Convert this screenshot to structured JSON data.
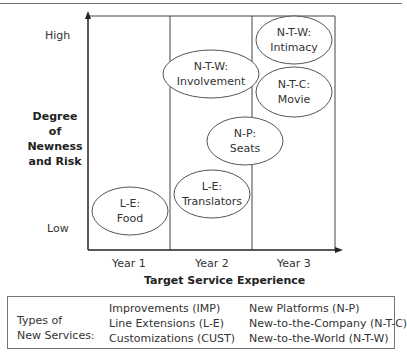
{
  "diagram": {
    "y_axis": {
      "label_lines": [
        "Degree of",
        "Newness",
        "and Risk"
      ],
      "high": "High",
      "low": "Low"
    },
    "x_axis": {
      "label": "Target Service Experience",
      "ticks": [
        "Year 1",
        "Year 2",
        "Year 3"
      ]
    },
    "nodes": [
      {
        "code": "N-T-W:",
        "name": "Involvement",
        "column": "Year 2"
      },
      {
        "code": "N-T-W:",
        "name": "Intimacy",
        "column": "Year 3"
      },
      {
        "code": "N-T-C:",
        "name": "Movie",
        "column": "Year 3"
      },
      {
        "code": "N-P:",
        "name": "Seats",
        "column": "Year 2-3"
      },
      {
        "code": "L-E:",
        "name": "Translators",
        "column": "Year 2"
      },
      {
        "code": "L-E:",
        "name": "Food",
        "column": "Year 1"
      }
    ],
    "colors": {
      "line": "#333333",
      "ellipse": "#555555"
    }
  },
  "legend": {
    "title_lines": [
      "Types of",
      "New Services:"
    ],
    "col1": [
      "Improvements (IMP)",
      "Line Extensions (L-E)",
      "Customizations (CUST)"
    ],
    "col2": [
      "New Platforms (N-P)",
      "New-to-the-Company (N-T-C)",
      "New-to-the-World (N-T-W)"
    ]
  }
}
